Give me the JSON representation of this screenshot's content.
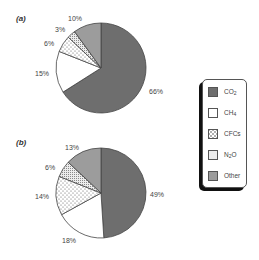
{
  "chart_data": [
    {
      "type": "pie",
      "title": "(a)",
      "categories": [
        "CO2",
        "CH4",
        "CFCs",
        "N2O",
        "Other"
      ],
      "values": [
        66,
        15,
        6,
        3,
        10
      ],
      "labels": [
        "66%",
        "15%",
        "6%",
        "3%",
        "10%"
      ],
      "start_angle": "12 o'clock, clockwise",
      "legend_position": "right"
    },
    {
      "type": "pie",
      "title": "(b)",
      "categories": [
        "CO2",
        "CH4",
        "CFCs",
        "N2O",
        "Other"
      ],
      "values": [
        49,
        18,
        14,
        6,
        13
      ],
      "labels": [
        "49%",
        "18%",
        "14%",
        "6%",
        "13%"
      ],
      "start_angle": "12 o'clock, clockwise",
      "legend_position": "right"
    }
  ],
  "panels": {
    "a": {
      "label": "(a)",
      "co2": "66%",
      "ch4": "15%",
      "cfcs": "6%",
      "n2o": "3%",
      "other": "10%"
    },
    "b": {
      "label": "(b)",
      "co2": "49%",
      "ch4": "18%",
      "cfcs": "14%",
      "n2o": "6%",
      "other": "13%"
    }
  },
  "legend": {
    "items": [
      {
        "key": "CO2",
        "base": "CO",
        "sub": "2",
        "tail": "",
        "color": "#6e6e6e",
        "pattern": "solid-dark"
      },
      {
        "key": "CH4",
        "base": "CH",
        "sub": "4",
        "tail": "",
        "color": "#ffffff",
        "pattern": "solid-white"
      },
      {
        "key": "CFCs",
        "base": "CFCs",
        "sub": "",
        "tail": "",
        "color": "#ffffff",
        "pattern": "cross-dots"
      },
      {
        "key": "N2O",
        "base": "N",
        "sub": "2",
        "tail": "O",
        "color": "#ffffff",
        "pattern": "fine-stipple"
      },
      {
        "key": "Other",
        "base": "Other",
        "sub": "",
        "tail": "",
        "color": "#9c9c9c",
        "pattern": "solid-light"
      }
    ]
  },
  "colors": {
    "co2": "#6e6e6e",
    "ch4": "#ffffff",
    "other": "#9c9c9c",
    "outline": "#444444"
  }
}
